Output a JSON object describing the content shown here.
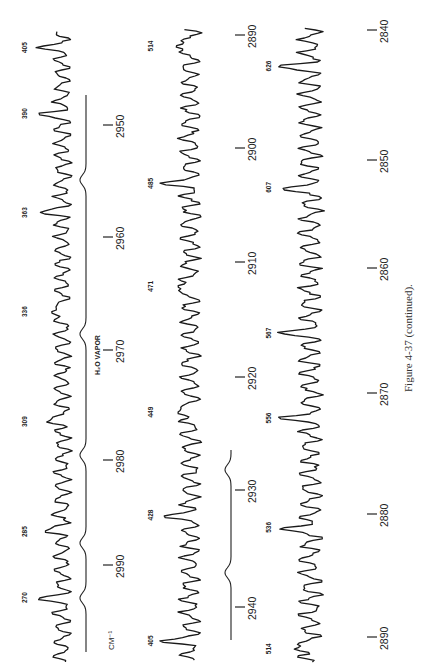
{
  "figure": {
    "caption": "Figure 4-37 (continued).",
    "unit_label": "CM⁻¹",
    "annotation": "H₂O VAPOR"
  },
  "chart_data": {
    "type": "line",
    "title": "Figure 4-37 (continued).",
    "xlabel": "CM⁻¹",
    "ylabel": "",
    "orientation": "rotated 90° counter-clockwise on page; wavenumber decreases upward",
    "grid": false,
    "legend": null,
    "panels": [
      {
        "name": "strip-1",
        "x_range": [
          2995,
          2945
        ],
        "ticks": [
          2990,
          2980,
          2970,
          2960,
          2950
        ],
        "peak_labels": [
          {
            "label": "270",
            "wavenumber": 2993
          },
          {
            "label": "285",
            "wavenumber": 2987
          },
          {
            "label": "309",
            "wavenumber": 2977
          },
          {
            "label": "336",
            "wavenumber": 2967
          },
          {
            "label": "363",
            "wavenumber": 2958
          },
          {
            "label": "390",
            "wavenumber": 2949
          },
          {
            "label": "405",
            "wavenumber": 2943
          }
        ],
        "reference_trace": "H₂O vapor",
        "reference_dips": [
          2993,
          2988,
          2980,
          2969,
          2955
        ]
      },
      {
        "name": "strip-2",
        "x_range": [
          2946,
          2886
        ],
        "ticks": [
          2940,
          2930,
          2920,
          2910,
          2900,
          2890
        ],
        "peak_labels": [
          {
            "label": "405",
            "wavenumber": 2943
          },
          {
            "label": "428",
            "wavenumber": 2932
          },
          {
            "label": "449",
            "wavenumber": 2923
          },
          {
            "label": "471",
            "wavenumber": 2912
          },
          {
            "label": "485",
            "wavenumber": 2903
          },
          {
            "label": "514",
            "wavenumber": 2891
          }
        ],
        "reference_trace": "H₂O vapor (partial)",
        "reference_dips": [
          2937,
          2928
        ]
      },
      {
        "name": "strip-3",
        "x_range": [
          2893,
          2837
        ],
        "ticks": [
          2890,
          2880,
          2870,
          2860,
          2850,
          2840
        ],
        "peak_labels": [
          {
            "label": "514",
            "wavenumber": 2891
          },
          {
            "label": "536",
            "wavenumber": 2881
          },
          {
            "label": "556",
            "wavenumber": 2872
          },
          {
            "label": "567",
            "wavenumber": 2865
          },
          {
            "label": "607",
            "wavenumber": 2853
          },
          {
            "label": "626",
            "wavenumber": 2843
          }
        ]
      }
    ]
  },
  "layout": {
    "strips": [
      {
        "trace_x": 62,
        "trace_amp": 26,
        "ref_x": 86,
        "tick_x": 108,
        "y_top": 30,
        "y_bot": 662,
        "tick_y": {
          "2990": 565,
          "2980": 460,
          "2970": 350,
          "2960": 237,
          "2950": 125
        },
        "seed": 11
      },
      {
        "trace_x": 190,
        "trace_amp": 30,
        "ref_x": 231,
        "tick_x": 240,
        "y_top": 28,
        "y_bot": 660,
        "tick_y": {
          "2940": 607,
          "2930": 490,
          "2920": 377,
          "2910": 262,
          "2900": 148,
          "2890": 35
        },
        "seed": 29
      },
      {
        "trace_x": 310,
        "trace_amp": 34,
        "tick_x": 372,
        "y_top": 28,
        "y_bot": 662,
        "tick_y": {
          "2890": 637,
          "2880": 514,
          "2870": 393,
          "2860": 268,
          "2850": 160,
          "2840": 30
        },
        "seed": 47
      }
    ]
  }
}
